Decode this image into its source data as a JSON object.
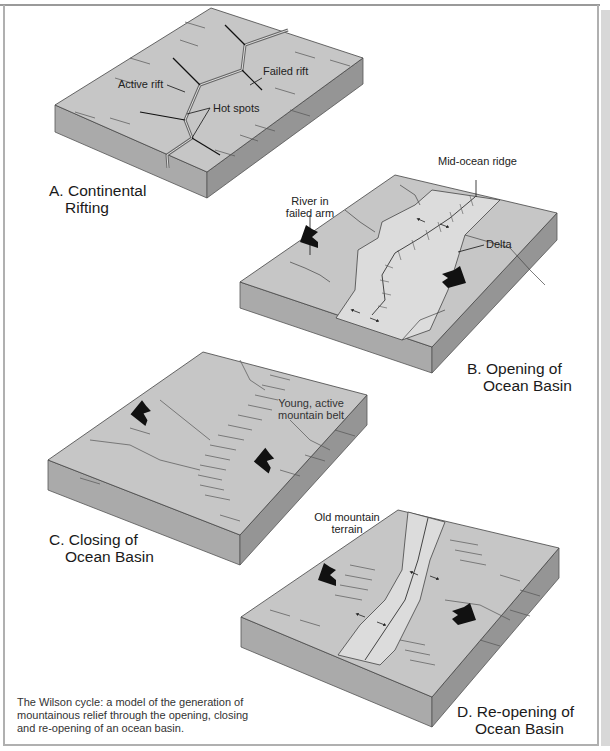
{
  "page": {
    "header_fragment": "ISSUES · LOCAL AND REGIONAL ENVIRONMENTS",
    "page_number": "21"
  },
  "colors": {
    "land_top": "#c6c6c6",
    "ocean_strip": "#dcdcdc",
    "left_side": "#aaaaaa",
    "right_side": "#959595",
    "line": "#3a3a3a",
    "arrow": "#111111"
  },
  "panels": {
    "a": {
      "title_line1": "A. Continental",
      "title_line2": "Rifting",
      "labels": {
        "active_rift": "Active rift",
        "failed_rift": "Failed rift",
        "hot_spots": "Hot spots"
      }
    },
    "b": {
      "title_line1": "B. Opening of",
      "title_line2": "Ocean Basin",
      "labels": {
        "mid_ocean_ridge": "Mid-ocean ridge",
        "river_line1": "River in",
        "river_line2": "failed arm",
        "delta": "Delta"
      }
    },
    "c": {
      "title_line1": "C. Closing of",
      "title_line2": "Ocean Basin",
      "labels": {
        "mountain_line1": "Young, active",
        "mountain_line2": "mountain belt"
      }
    },
    "d": {
      "title_line1": "D. Re-opening of",
      "title_line2": "Ocean Basin",
      "labels": {
        "old_line1": "Old mountain",
        "old_line2": "terrain"
      }
    }
  },
  "caption": "The Wilson cycle: a model of the generation of mountainous relief through the opening, closing and re-opening of an ocean basin."
}
